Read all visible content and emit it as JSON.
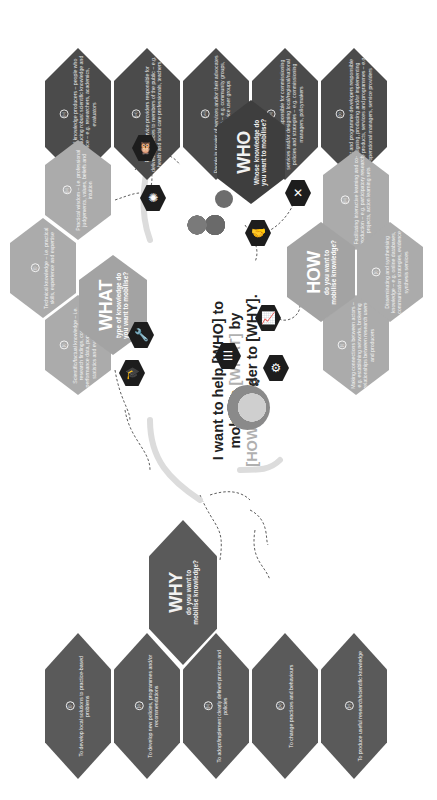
{
  "headline": {
    "line1": "I want to help [WHO] to",
    "line2_pre": "mobilise ",
    "line2_hl": "[WHAT]",
    "line2_post": " by",
    "line3_hl": "[HOW]",
    "line3_post": " in order to [WHY]."
  },
  "who": {
    "title": "WHO",
    "subtitle_line1": "Whose knowledge do",
    "subtitle_line2": "you want to mobilise?",
    "items": [
      {
        "num": "(vi)",
        "text": "Professional knowledge producers – people who focus on producing robust scientific knowledge and evidence – e.g. researchers, academics, evaluators"
      },
      {
        "num": "(vii)",
        "text": "Frontline service providers responsible for delivering services to members of the public – e.g. health and social care professionals, teachers"
      },
      {
        "num": "(viii)",
        "text": "People in receipt of services and/or their advocates and representatives – e.g. community groups, charities, service user groups"
      },
      {
        "num": "(ix)",
        "text": "Decision makers responsible for commissioning services and/or designing local/regional/national policies and strategies – e.g. commissioning managers, policymakers"
      },
      {
        "num": "(x)",
        "text": "Product and programme developers responsible for designing, producing and/or implementing tangible products, services and programmes – e.g. operational managers, service providers"
      }
    ]
  },
  "what": {
    "title": "WHAT",
    "subtitle_line1": "type of knowledge do",
    "subtitle_line2": "you want to mobilise?",
    "items": [
      {
        "num": "(iii)",
        "text": "Practical wisdom – i.e. professional judgements, values, beliefs and intuition"
      },
      {
        "num": "(i)",
        "text": "Technical knowledge – i.e. practical skills, experience and expertise"
      },
      {
        "num": "(ii)",
        "text": "Scientific/factual knowledge – i.e. research findings, country and performance data, population data & statistics and evaluation data"
      }
    ]
  },
  "how": {
    "title": "HOW",
    "subtitle_line1": "do you want to",
    "subtitle_line2": "mobilise knowledge?",
    "items": [
      {
        "num": "(iii)",
        "text": "Facilitating interactive learning and co-production – e.g. participatory research projects, action learning sets"
      },
      {
        "num": "(ii)",
        "text": "Disseminating and synthesising knowledge – e.g. online databases, communication strategies, evidence synthesis services"
      },
      {
        "num": "(i)",
        "text": "Making connections between actors – e.g. establishing networks, brokering relationships between research users and producers"
      }
    ]
  },
  "why": {
    "title": "WHY",
    "subtitle_line1": "do you want to",
    "subtitle_line2": "mobilise knowledge?",
    "items": [
      {
        "num": "(i)",
        "text": "To develop local solutions to practice-based problems"
      },
      {
        "num": "(ii)",
        "text": "To develop new policies, programmes and/or recommendations"
      },
      {
        "num": "(iii)",
        "text": "To adopt/implement clearly defined practices and policies"
      },
      {
        "num": "(iv)",
        "text": "To change practices and behaviours"
      },
      {
        "num": "(v)",
        "text": "To produce useful research/scientific knowledge"
      }
    ]
  },
  "icons": {
    "owl": "🦉",
    "brain": "✺",
    "wrench": "🔧",
    "grad_cap": "🎓",
    "document": "☰",
    "gears": "⚙",
    "handshake": "🤝",
    "tools": "✕",
    "chart": "📈",
    "bee": "✿"
  }
}
